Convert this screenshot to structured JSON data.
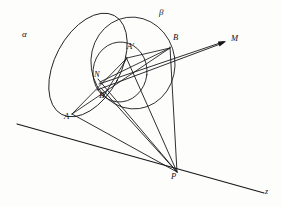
{
  "figure": {
    "kind": "projective-geometry-construction",
    "background": "#fdfdfc",
    "ink": "#17161a",
    "width": 282,
    "height": 207
  },
  "labels": {
    "alpha": "α",
    "beta": "β",
    "A": "A",
    "A_prime": "A'",
    "B": "B",
    "B_prime": "B'",
    "N": "N",
    "M": "M",
    "P": "P",
    "z": "z"
  },
  "points": {
    "A": {
      "x": 72,
      "y": 114,
      "label_x": 66,
      "label_y": 114
    },
    "A_prime": {
      "x": 127,
      "y": 58,
      "label_x": 128,
      "label_y": 45
    },
    "B": {
      "x": 170,
      "y": 48,
      "label_x": 173,
      "label_y": 36
    },
    "B_prime": {
      "x": 106,
      "y": 92,
      "label_x": 100,
      "label_y": 93
    },
    "N": {
      "x": 101,
      "y": 81,
      "label_x": 96,
      "label_y": 74
    },
    "M": {
      "x": 226,
      "y": 41,
      "label_x": 231,
      "label_y": 36
    },
    "P": {
      "x": 177,
      "y": 172,
      "label_x": 172,
      "label_y": 174
    },
    "z_end": {
      "x": 264,
      "y": 193,
      "label_x": 265,
      "label_y": 190
    }
  },
  "conics": [
    {
      "name": "alpha",
      "type": "ellipse",
      "label": "α",
      "label_x": 22,
      "label_y": 34,
      "cx": 88,
      "cy": 65,
      "rx": 33,
      "ry": 56,
      "rotation": 28
    },
    {
      "name": "beta",
      "type": "ellipse",
      "label": "β",
      "label_x": 159,
      "label_y": 12,
      "cx": 133,
      "cy": 63,
      "rx": 42,
      "ry": 46,
      "rotation": -8
    },
    {
      "name": "inner-circle",
      "type": "circle",
      "label": "",
      "cx": 120,
      "cy": 72,
      "rx": 27,
      "ry": 30,
      "rotation": 6
    }
  ],
  "lines": {
    "axis_z": {
      "from_x": 17,
      "from_y": 124,
      "to_x": 264,
      "to_y": 193
    },
    "pencil_from_P": [
      {
        "name": "P-A",
        "to_x": 72,
        "to_y": 114
      },
      {
        "name": "P-B'",
        "to_x": 101,
        "to_y": 88
      },
      {
        "name": "P-N",
        "to_x": 98,
        "to_y": 79
      },
      {
        "name": "P-A'",
        "to_x": 126,
        "to_y": 57
      },
      {
        "name": "P-B",
        "to_x": 170,
        "to_y": 47
      }
    ],
    "rays_to_M": [
      {
        "name": "N-M",
        "from_x": 99,
        "from_y": 84,
        "to_x": 224,
        "to_y": 42
      },
      {
        "name": "B'-M",
        "from_x": 97,
        "from_y": 89,
        "to_x": 224,
        "to_y": 43
      }
    ],
    "chords": [
      {
        "name": "A-B",
        "from_x": 72,
        "from_y": 114,
        "to_x": 170,
        "to_y": 48
      },
      {
        "name": "A-A'",
        "from_x": 72,
        "from_y": 114,
        "to_x": 127,
        "to_y": 58
      },
      {
        "name": "A'-B",
        "from_x": 127,
        "from_y": 58,
        "to_x": 170,
        "to_y": 48
      },
      {
        "name": "A'-Bprime",
        "from_x": 127,
        "from_y": 58,
        "to_x": 104,
        "to_y": 95
      },
      {
        "name": "N-B",
        "from_x": 101,
        "from_y": 81,
        "to_x": 170,
        "to_y": 48
      },
      {
        "name": "B-P-vert",
        "from_x": 170,
        "from_y": 48,
        "to_x": 177,
        "to_y": 172
      }
    ]
  }
}
